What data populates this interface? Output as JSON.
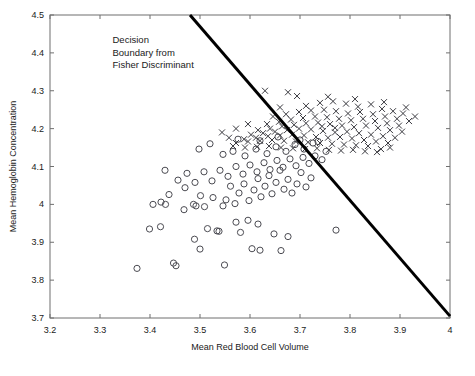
{
  "chart_data": {
    "type": "scatter",
    "title": "",
    "xlabel": "Mean Red Blood Cell Volume",
    "ylabel": "Mean Hemoglobin Concentration",
    "xlim": [
      3.2,
      4.0
    ],
    "ylim": [
      3.7,
      4.5
    ],
    "xticks": [
      3.2,
      3.3,
      3.4,
      3.5,
      3.6,
      3.7,
      3.8,
      3.9,
      4.0
    ],
    "xticklabels": [
      "3.2",
      "3.3",
      "3.4",
      "3.5",
      "3.6",
      "3.7",
      "3.8",
      "3.9",
      "4"
    ],
    "yticks": [
      3.7,
      3.8,
      3.9,
      4.0,
      4.1,
      4.2,
      4.3,
      4.4,
      4.5
    ],
    "yticklabels": [
      "3.7",
      "3.8",
      "3.9",
      "4",
      "4.1",
      "4.2",
      "4.3",
      "4.4",
      "4.5"
    ],
    "grid": false,
    "legend": "none",
    "annotations": [
      {
        "name": "decision-boundary-label",
        "lines": [
          "Decision",
          "Boundary from",
          "Fisher Discriminant"
        ],
        "x": 3.325,
        "y": 4.425
      }
    ],
    "lines": [
      {
        "name": "decision-boundary",
        "label": "Decision Boundary from Fisher Discriminant",
        "color": "#000000",
        "width": 3,
        "x": [
          3.48,
          4.0
        ],
        "y": [
          4.5,
          3.705
        ]
      }
    ],
    "series": [
      {
        "name": "class-circle",
        "marker": "o",
        "color": "#4b4b52",
        "points": [
          [
            3.374,
            3.831
          ],
          [
            3.447,
            3.845
          ],
          [
            3.452,
            3.838
          ],
          [
            3.5,
            3.882
          ],
          [
            3.549,
            3.84
          ],
          [
            3.581,
            3.926
          ],
          [
            3.604,
            3.883
          ],
          [
            3.62,
            3.879
          ],
          [
            3.662,
            3.878
          ],
          [
            3.399,
            3.935
          ],
          [
            3.421,
            3.941
          ],
          [
            3.489,
            3.908
          ],
          [
            3.515,
            3.936
          ],
          [
            3.534,
            3.93
          ],
          [
            3.538,
            3.929
          ],
          [
            3.572,
            3.953
          ],
          [
            3.596,
            3.958
          ],
          [
            3.616,
            3.948
          ],
          [
            3.648,
            3.922
          ],
          [
            3.676,
            3.915
          ],
          [
            3.422,
            4.006
          ],
          [
            3.431,
            4.0
          ],
          [
            3.438,
            4.026
          ],
          [
            3.468,
            3.986
          ],
          [
            3.487,
            4.0
          ],
          [
            3.501,
            4.023
          ],
          [
            3.509,
            3.994
          ],
          [
            3.526,
            4.018
          ],
          [
            3.546,
            3.996
          ],
          [
            3.552,
            4.012
          ],
          [
            3.561,
            4.048
          ],
          [
            3.57,
            4.002
          ],
          [
            3.578,
            4.03
          ],
          [
            3.588,
            4.054
          ],
          [
            3.598,
            4.01
          ],
          [
            3.608,
            4.038
          ],
          [
            3.616,
            4.068
          ],
          [
            3.622,
            4.02
          ],
          [
            3.63,
            4.048
          ],
          [
            3.638,
            4.076
          ],
          [
            3.644,
            4.028
          ],
          [
            3.652,
            4.058
          ],
          [
            3.66,
            4.09
          ],
          [
            3.668,
            4.04
          ],
          [
            3.676,
            4.066
          ],
          [
            3.684,
            4.03
          ],
          [
            3.694,
            4.054
          ],
          [
            3.702,
            4.084
          ],
          [
            3.712,
            4.046
          ],
          [
            3.722,
            4.07
          ],
          [
            3.456,
            4.064
          ],
          [
            3.474,
            4.082
          ],
          [
            3.49,
            4.058
          ],
          [
            3.508,
            4.086
          ],
          [
            3.524,
            4.062
          ],
          [
            3.54,
            4.09
          ],
          [
            3.556,
            4.074
          ],
          [
            3.572,
            4.1
          ],
          [
            3.586,
            4.08
          ],
          [
            3.6,
            4.104
          ],
          [
            3.614,
            4.086
          ],
          [
            3.628,
            4.11
          ],
          [
            3.64,
            4.092
          ],
          [
            3.654,
            4.116
          ],
          [
            3.666,
            4.098
          ],
          [
            3.68,
            4.12
          ],
          [
            3.692,
            4.102
          ],
          [
            3.706,
            4.124
          ],
          [
            3.718,
            4.108
          ],
          [
            3.73,
            4.128
          ],
          [
            3.546,
            4.132
          ],
          [
            3.566,
            4.14
          ],
          [
            3.59,
            4.128
          ],
          [
            3.612,
            4.146
          ],
          [
            3.634,
            4.134
          ],
          [
            3.652,
            4.152
          ],
          [
            3.672,
            4.14
          ],
          [
            3.69,
            4.158
          ],
          [
            3.708,
            4.146
          ],
          [
            3.726,
            4.162
          ],
          [
            3.744,
            4.118
          ],
          [
            3.498,
            4.146
          ],
          [
            3.52,
            4.16
          ],
          [
            3.576,
            4.172
          ],
          [
            3.62,
            4.168
          ],
          [
            3.656,
            4.178
          ],
          [
            3.7,
            4.17
          ],
          [
            3.736,
            4.166
          ],
          [
            3.752,
            4.14
          ],
          [
            3.772,
            3.932
          ],
          [
            3.492,
            3.996
          ],
          [
            3.47,
            4.044
          ],
          [
            3.43,
            4.09
          ],
          [
            3.406,
            4.0
          ]
        ]
      },
      {
        "name": "class-cross",
        "marker": "x",
        "color": "#3a3a40",
        "points": [
          [
            3.694,
            4.286
          ],
          [
            3.66,
            4.256
          ],
          [
            3.712,
            4.26
          ],
          [
            3.74,
            4.268
          ],
          [
            3.766,
            4.272
          ],
          [
            3.792,
            4.266
          ],
          [
            3.816,
            4.258
          ],
          [
            3.842,
            4.264
          ],
          [
            3.864,
            4.252
          ],
          [
            3.886,
            4.246
          ],
          [
            3.906,
            4.24
          ],
          [
            3.646,
            4.232
          ],
          [
            3.672,
            4.238
          ],
          [
            3.698,
            4.244
          ],
          [
            3.722,
            4.248
          ],
          [
            3.748,
            4.25
          ],
          [
            3.772,
            4.246
          ],
          [
            3.796,
            4.24
          ],
          [
            3.82,
            4.244
          ],
          [
            3.846,
            4.238
          ],
          [
            3.87,
            4.232
          ],
          [
            3.894,
            4.226
          ],
          [
            3.918,
            4.22
          ],
          [
            3.634,
            4.212
          ],
          [
            3.658,
            4.218
          ],
          [
            3.682,
            4.224
          ],
          [
            3.706,
            4.228
          ],
          [
            3.73,
            4.232
          ],
          [
            3.754,
            4.23
          ],
          [
            3.778,
            4.226
          ],
          [
            3.802,
            4.222
          ],
          [
            3.826,
            4.226
          ],
          [
            3.85,
            4.22
          ],
          [
            3.874,
            4.214
          ],
          [
            3.898,
            4.208
          ],
          [
            3.616,
            4.196
          ],
          [
            3.64,
            4.2
          ],
          [
            3.664,
            4.206
          ],
          [
            3.688,
            4.21
          ],
          [
            3.712,
            4.214
          ],
          [
            3.736,
            4.216
          ],
          [
            3.76,
            4.212
          ],
          [
            3.784,
            4.208
          ],
          [
            3.808,
            4.204
          ],
          [
            3.832,
            4.208
          ],
          [
            3.856,
            4.202
          ],
          [
            3.88,
            4.196
          ],
          [
            3.904,
            4.192
          ],
          [
            3.602,
            4.184
          ],
          [
            3.626,
            4.188
          ],
          [
            3.65,
            4.192
          ],
          [
            3.674,
            4.196
          ],
          [
            3.698,
            4.2
          ],
          [
            3.722,
            4.198
          ],
          [
            3.746,
            4.194
          ],
          [
            3.77,
            4.19
          ],
          [
            3.794,
            4.192
          ],
          [
            3.818,
            4.188
          ],
          [
            3.842,
            4.184
          ],
          [
            3.866,
            4.18
          ],
          [
            3.89,
            4.176
          ],
          [
            3.588,
            4.172
          ],
          [
            3.612,
            4.176
          ],
          [
            3.636,
            4.18
          ],
          [
            3.66,
            4.182
          ],
          [
            3.684,
            4.184
          ],
          [
            3.708,
            4.182
          ],
          [
            3.732,
            4.178
          ],
          [
            3.756,
            4.176
          ],
          [
            3.78,
            4.178
          ],
          [
            3.804,
            4.174
          ],
          [
            3.828,
            4.17
          ],
          [
            3.852,
            4.166
          ],
          [
            3.876,
            4.162
          ],
          [
            3.572,
            4.162
          ],
          [
            3.596,
            4.166
          ],
          [
            3.62,
            4.168
          ],
          [
            3.644,
            4.17
          ],
          [
            3.668,
            4.168
          ],
          [
            3.692,
            4.166
          ],
          [
            3.716,
            4.164
          ],
          [
            3.74,
            4.162
          ],
          [
            3.764,
            4.16
          ],
          [
            3.788,
            4.158
          ],
          [
            3.812,
            4.156
          ],
          [
            3.836,
            4.154
          ],
          [
            3.544,
            4.19
          ],
          [
            3.558,
            4.176
          ],
          [
            3.566,
            4.154
          ],
          [
            3.59,
            4.15
          ],
          [
            3.614,
            4.152
          ],
          [
            3.638,
            4.154
          ],
          [
            3.662,
            4.15
          ],
          [
            3.686,
            4.148
          ],
          [
            3.71,
            4.146
          ],
          [
            3.734,
            4.148
          ],
          [
            3.758,
            4.144
          ],
          [
            3.782,
            4.142
          ],
          [
            3.806,
            4.144
          ],
          [
            3.83,
            4.14
          ],
          [
            3.854,
            4.138
          ],
          [
            3.63,
            4.3
          ],
          [
            3.676,
            4.296
          ],
          [
            3.756,
            4.284
          ],
          [
            3.81,
            4.278
          ],
          [
            3.868,
            4.27
          ],
          [
            3.912,
            4.256
          ],
          [
            3.93,
            4.232
          ],
          [
            3.744,
            4.206
          ],
          [
            3.77,
            4.202
          ],
          [
            3.88,
            4.15
          ],
          [
            3.862,
            4.146
          ],
          [
            3.596,
            4.212
          ],
          [
            3.572,
            4.2
          ]
        ]
      }
    ]
  },
  "axes": {
    "x_title": "Mean Red Blood Cell Volume",
    "y_title": "Mean Hemoglobin Concentration"
  }
}
